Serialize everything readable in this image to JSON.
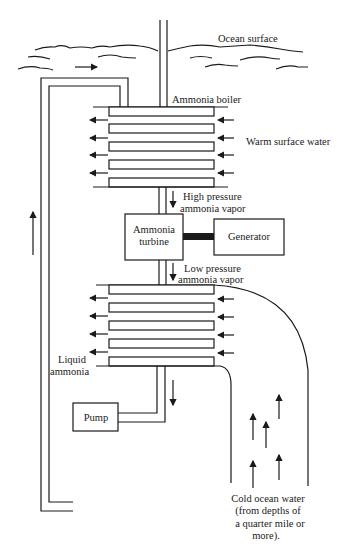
{
  "diagram": {
    "labels": {
      "ocean_surface": "Ocean surface",
      "ammonia_boiler": "Ammonia boiler",
      "warm_surface_water": "Warm surface water",
      "high_pressure_1": "High pressure",
      "high_pressure_2": "ammonia vapor",
      "turbine_1": "Ammonia",
      "turbine_2": "turbine",
      "generator": "Generator",
      "low_pressure_1": "Low pressure",
      "low_pressure_2": "ammonia vapor",
      "liquid_ammonia_1": "Liquid",
      "liquid_ammonia_2": "ammonia",
      "pump": "Pump",
      "cold_water_1": "Cold ocean water",
      "cold_water_2": "(from depths of",
      "cold_water_3": "a quarter mile or",
      "cold_water_4": "more)."
    },
    "components": [
      "Ammonia boiler",
      "Ammonia turbine",
      "Generator",
      "Condenser",
      "Pump"
    ],
    "colors": {
      "ink": "#1a1a1a",
      "background": "#ffffff"
    }
  }
}
